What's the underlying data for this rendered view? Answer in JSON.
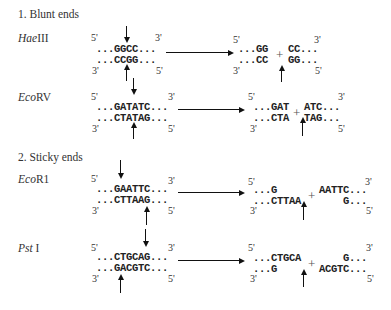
{
  "sections": [
    {
      "heading": "1. Blunt ends",
      "enzymes": [
        {
          "name_italic": "Hae",
          "name_roman": "III",
          "substrate": {
            "top": "...GGCC...",
            "bottom": "...CCGG..."
          },
          "product_left": {
            "top": "...GG",
            "bottom": "...CC"
          },
          "product_right": {
            "top": "CC...",
            "bottom": "GG..."
          }
        },
        {
          "name_italic": "Eco",
          "name_roman": "RV",
          "substrate": {
            "top": "...GATATC...",
            "bottom": "...CTATAG..."
          },
          "product_left": {
            "top": "...GAT",
            "bottom": "...CTA"
          },
          "product_right": {
            "top": "ATC...",
            "bottom": "TAG..."
          }
        }
      ]
    },
    {
      "heading": "2. Sticky ends",
      "enzymes": [
        {
          "name_italic": "Eco",
          "name_roman": "R1",
          "substrate": {
            "top": "...GAATTC...",
            "bottom": "...CTTAAG..."
          },
          "product_left": {
            "top": "...G",
            "bottom": "...CTTAA"
          },
          "product_right": {
            "top": "AATTC...",
            "bottom": "G..."
          }
        },
        {
          "name_italic": "Pst",
          "name_roman": " I",
          "substrate": {
            "top": "...CTGCAG...",
            "bottom": "...GACGTC..."
          },
          "product_left": {
            "top": "...CTGCA",
            "bottom": "...G"
          },
          "product_right": {
            "top": "G...",
            "bottom": "ACGTC..."
          }
        }
      ]
    }
  ],
  "labels": {
    "five_prime": "5'",
    "three_prime": "3'",
    "plus": "+"
  }
}
